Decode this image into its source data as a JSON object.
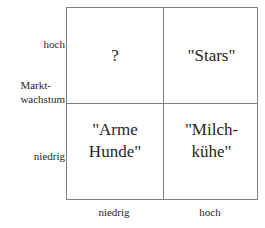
{
  "figure": {
    "type": "bcg-portfolio-matrix",
    "line_color": "#808080",
    "text_color": "#262626",
    "background_color": "#ffffff"
  },
  "y_axis": {
    "title": "Markt-\nwachstum",
    "high_label": "hoch",
    "low_label": "niedrig"
  },
  "x_axis": {
    "low_label": "niedrig",
    "high_label": "hoch"
  },
  "quadrants": {
    "top_left": "?",
    "top_right": "\"Stars\"",
    "bottom_left": "\"Arme\nHunde\"",
    "bottom_right": "\"Milch-\nkühe\""
  },
  "chart_data": {
    "type": "table",
    "title": "",
    "xlabel": "",
    "ylabel": "Markt-wachstum",
    "x_categories": [
      "niedrig",
      "hoch"
    ],
    "y_categories": [
      "hoch",
      "niedrig"
    ],
    "cells": [
      {
        "y": "hoch",
        "x": "niedrig",
        "label": "?"
      },
      {
        "y": "hoch",
        "x": "hoch",
        "label": "\"Stars\""
      },
      {
        "y": "niedrig",
        "x": "niedrig",
        "label": "\"Arme Hunde\""
      },
      {
        "y": "niedrig",
        "x": "hoch",
        "label": "\"Milch-kühe\""
      }
    ],
    "grid": true,
    "legend": "none"
  }
}
